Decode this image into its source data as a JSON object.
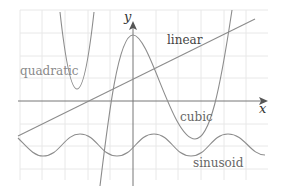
{
  "diagram": {
    "title": "",
    "axes": {
      "x_label": "x",
      "y_label": "y"
    },
    "colors": {
      "grid": "#e6e6e6",
      "axis": "#777777",
      "curve": "#8c8c8c",
      "label": "#8a8a8a",
      "axis_label": "#333333"
    },
    "curves": [
      {
        "name": "quadratic",
        "label": "quadratic"
      },
      {
        "name": "linear",
        "label": "linear"
      },
      {
        "name": "cubic",
        "label": "cubic"
      },
      {
        "name": "sinusoid",
        "label": "sinusoid"
      }
    ]
  }
}
